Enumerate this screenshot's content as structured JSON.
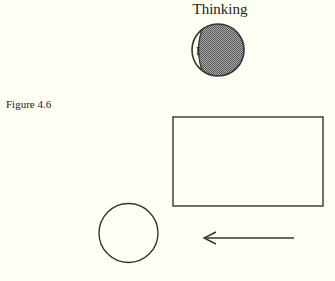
{
  "figure": {
    "caption": "Figure 4.6",
    "title": "Thinking",
    "head_label": "I",
    "colors": {
      "background": "#fefef2",
      "stroke": "#333333",
      "shaded_fill": "#8c8c8c"
    }
  }
}
